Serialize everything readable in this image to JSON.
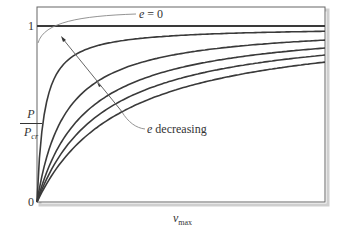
{
  "chart_data": {
    "type": "line",
    "title": "",
    "xlabel": "v_max",
    "ylabel": "P / P_cr",
    "ylim": [
      0,
      1.1
    ],
    "xlim": [
      0,
      1
    ],
    "grid": false,
    "y_ticks": [
      "0",
      "1"
    ],
    "x_ticks": [],
    "series": [
      {
        "name": "e = 0",
        "style": "horizontal line at P/Pcr = 1",
        "x": [
          0,
          1
        ],
        "y": [
          1,
          1
        ]
      },
      {
        "name": "e1 (smallest)",
        "x": [
          0,
          0.05,
          0.1,
          0.25,
          0.5,
          1.0
        ],
        "y": [
          0,
          0.7,
          0.8,
          0.9,
          0.95,
          0.97
        ]
      },
      {
        "name": "e2",
        "x": [
          0,
          0.1,
          0.25,
          0.5,
          1.0
        ],
        "y": [
          0,
          0.45,
          0.68,
          0.82,
          0.92
        ]
      },
      {
        "name": "e3",
        "x": [
          0,
          0.1,
          0.25,
          0.5,
          1.0
        ],
        "y": [
          0,
          0.35,
          0.58,
          0.75,
          0.875
        ]
      },
      {
        "name": "e4",
        "x": [
          0,
          0.1,
          0.25,
          0.5,
          1.0
        ],
        "y": [
          0,
          0.3,
          0.52,
          0.7,
          0.835
        ]
      },
      {
        "name": "e5 (largest)",
        "x": [
          0,
          0.1,
          0.25,
          0.5,
          1.0
        ],
        "y": [
          0,
          0.26,
          0.47,
          0.65,
          0.795
        ]
      }
    ],
    "annotations": [
      {
        "text": "e = 0",
        "points_to": "horizontal line P/Pcr = 1"
      },
      {
        "text": "e decreasing",
        "arrow": "points toward upper-left, across curves"
      }
    ]
  },
  "labels": {
    "tick_one": "1",
    "tick_zero": "0",
    "ylabel_num": "P",
    "ylabel_den": "P",
    "ylabel_den_sub": "cr",
    "xlabel_main": "v",
    "xlabel_sub": "max",
    "ann_e0_var": "e",
    "ann_e0_rest": " = 0",
    "ann_dec_var": "e",
    "ann_dec_rest": " decreasing"
  },
  "colors": {
    "curve": "#3a3a3a",
    "frame": "#555555",
    "shadow": "#c8c8c8",
    "annotation": "#777777"
  }
}
